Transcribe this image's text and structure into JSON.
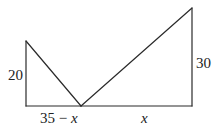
{
  "diagram": {
    "type": "geometry",
    "labels": {
      "left_height": "20",
      "right_height": "30",
      "left_base": "35 − x",
      "left_base_num": "35 − ",
      "left_base_var": "x",
      "right_base": "x"
    },
    "colors": {
      "stroke": "#2a2a2a",
      "text": "#222222"
    }
  }
}
